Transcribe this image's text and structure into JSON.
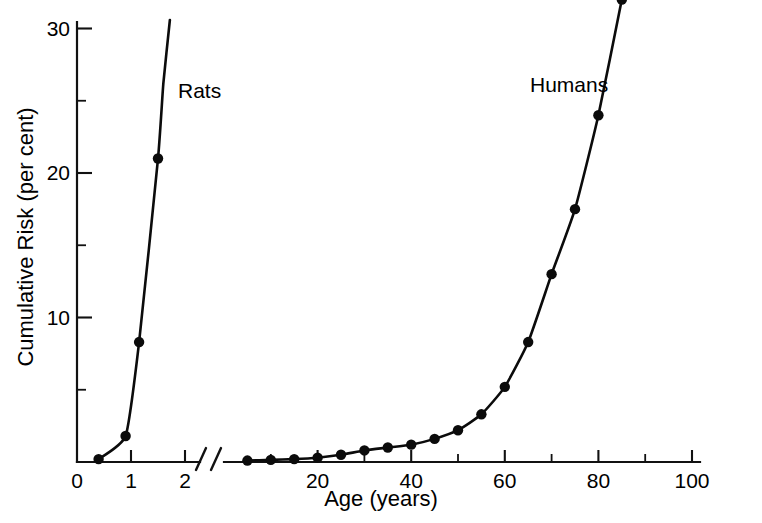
{
  "chart_data": {
    "type": "line",
    "title": "",
    "xlabel": "Age (years)",
    "ylabel": "Cumulative Risk (per cent)",
    "grid": false,
    "legend_position": "inline-annotation",
    "ylim": [
      0,
      32
    ],
    "y_ticks_major": [
      0,
      10,
      20,
      30
    ],
    "y_tick_labels": [
      "0",
      "10",
      "20",
      "30"
    ],
    "y_ticks_minor": [
      5,
      15,
      25
    ],
    "axis_break": {
      "present": true,
      "style": "double-slash",
      "between_panels": [
        "rats",
        "humans"
      ]
    },
    "panels": [
      {
        "name": "rats",
        "xlim": [
          0,
          2.3
        ],
        "x_ticks_major": [
          0,
          1,
          2
        ],
        "x_tick_labels": [
          "0",
          "1",
          "2"
        ],
        "x_units": "years"
      },
      {
        "name": "humans",
        "xlim": [
          0,
          100
        ],
        "x_ticks_major": [
          20,
          40,
          60,
          80,
          100
        ],
        "x_tick_labels": [
          "20",
          "40",
          "60",
          "80",
          "100"
        ],
        "x_ticks_minor": [
          10,
          30,
          50,
          70,
          90
        ],
        "x_units": "years"
      }
    ],
    "series": [
      {
        "name": "Rats",
        "label": "Rats",
        "panel": "rats",
        "color": "#0b0b0b",
        "x": [
          0.4,
          0.9,
          1.15,
          1.5
        ],
        "y": [
          0.2,
          1.8,
          8.3,
          21.0
        ],
        "curve_extends_above_axis": true,
        "curve_exit_x": 1.72
      },
      {
        "name": "Humans",
        "label": "Humans",
        "panel": "humans",
        "color": "#0b0b0b",
        "x": [
          5,
          10,
          15,
          20,
          25,
          30,
          35,
          40,
          45,
          50,
          55,
          60,
          65,
          70,
          75,
          80,
          85
        ],
        "y": [
          0.1,
          0.15,
          0.2,
          0.3,
          0.5,
          0.8,
          1.0,
          1.2,
          1.6,
          2.2,
          3.3,
          5.2,
          8.3,
          13.0,
          17.5,
          24.0,
          32.0
        ]
      }
    ],
    "annotations": [
      {
        "text": "Rats",
        "x_px": 178,
        "y_px": 80
      },
      {
        "text": "Humans",
        "x_px": 530,
        "y_px": 74
      }
    ]
  }
}
